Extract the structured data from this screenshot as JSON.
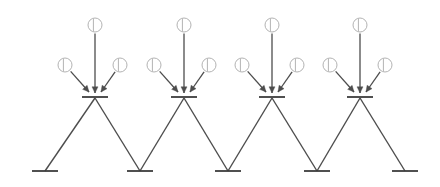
{
  "canvas": {
    "width": 440,
    "height": 187,
    "background": "#ffffff",
    "title": "Zigzag truss with point loads"
  },
  "style": {
    "member_color": "#4d4d4d",
    "member_width": 1.4,
    "arrow_color": "#4d4d4d",
    "arrow_width": 1.3,
    "plate_color": "#3d3d3d",
    "plate_width": 1.8,
    "node_symbol_color": "#b3b3b3",
    "node_symbol_width": 1.0,
    "node_symbol_radius": 7.0
  },
  "chart_data": {
    "type": "diagram",
    "xlabel": "",
    "ylabel": "",
    "apex_nodes": [
      {
        "id": "T1",
        "label": "",
        "x": 95,
        "y": 98
      },
      {
        "id": "T2",
        "label": "",
        "x": 184,
        "y": 98
      },
      {
        "id": "T3",
        "label": "",
        "x": 272,
        "y": 98
      },
      {
        "id": "T4",
        "label": "",
        "x": 360,
        "y": 98
      }
    ],
    "base_nodes": [
      {
        "id": "B1",
        "label": "",
        "x": 45,
        "y": 171
      },
      {
        "id": "B2",
        "label": "",
        "x": 140,
        "y": 171
      },
      {
        "id": "B3",
        "label": "",
        "x": 228,
        "y": 171
      },
      {
        "id": "B4",
        "label": "",
        "x": 317,
        "y": 171
      },
      {
        "id": "B5",
        "label": "",
        "x": 405,
        "y": 171
      }
    ],
    "members": [
      {
        "from": "B1",
        "to": "T1"
      },
      {
        "from": "T1",
        "to": "B2"
      },
      {
        "from": "B2",
        "to": "T2"
      },
      {
        "from": "T2",
        "to": "B3"
      },
      {
        "from": "B3",
        "to": "T3"
      },
      {
        "from": "T3",
        "to": "B4"
      },
      {
        "from": "B4",
        "to": "T4"
      },
      {
        "from": "T4",
        "to": "B5"
      }
    ],
    "plates": {
      "apex_half_width": 13,
      "apex_offset_y": -1,
      "base_half_width": 13,
      "base_offset_y": 0
    },
    "load_groups": [
      {
        "apex": "T1",
        "loads": [
          {
            "kind": "vertical",
            "symbol_x": 95,
            "symbol_y": 25,
            "tip_x": 95,
            "tip_y": 93
          },
          {
            "kind": "diagonal-left",
            "symbol_x": 65,
            "symbol_y": 65,
            "tip_x": 89,
            "tip_y": 92
          },
          {
            "kind": "diagonal-right",
            "symbol_x": 120,
            "symbol_y": 65,
            "tip_x": 101,
            "tip_y": 92
          }
        ]
      },
      {
        "apex": "T2",
        "loads": [
          {
            "kind": "vertical",
            "symbol_x": 184,
            "symbol_y": 25,
            "tip_x": 184,
            "tip_y": 93
          },
          {
            "kind": "diagonal-left",
            "symbol_x": 154,
            "symbol_y": 65,
            "tip_x": 178,
            "tip_y": 92
          },
          {
            "kind": "diagonal-right",
            "symbol_x": 209,
            "symbol_y": 65,
            "tip_x": 190,
            "tip_y": 92
          }
        ]
      },
      {
        "apex": "T3",
        "loads": [
          {
            "kind": "vertical",
            "symbol_x": 272,
            "symbol_y": 25,
            "tip_x": 272,
            "tip_y": 93
          },
          {
            "kind": "diagonal-left",
            "symbol_x": 242,
            "symbol_y": 65,
            "tip_x": 266,
            "tip_y": 92
          },
          {
            "kind": "diagonal-right",
            "symbol_x": 297,
            "symbol_y": 65,
            "tip_x": 278,
            "tip_y": 92
          }
        ]
      },
      {
        "apex": "T4",
        "loads": [
          {
            "kind": "vertical",
            "symbol_x": 360,
            "symbol_y": 25,
            "tip_x": 360,
            "tip_y": 93
          },
          {
            "kind": "diagonal-left",
            "symbol_x": 330,
            "symbol_y": 65,
            "tip_x": 354,
            "tip_y": 92
          },
          {
            "kind": "diagonal-right",
            "symbol_x": 385,
            "symbol_y": 65,
            "tip_x": 366,
            "tip_y": 92
          }
        ]
      }
    ],
    "annotations": [],
    "legend": []
  }
}
